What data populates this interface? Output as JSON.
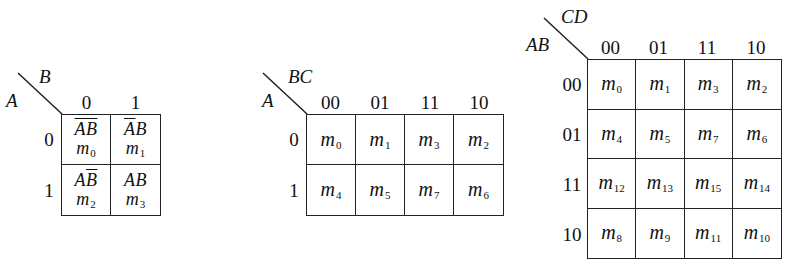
{
  "kmaps": [
    {
      "id": "two-variable",
      "row_var": "A",
      "col_var": "B",
      "col_headers": [
        "0",
        "1"
      ],
      "row_headers": [
        "0",
        "1"
      ],
      "cells": [
        [
          {
            "term_parts": [
              {
                "t": "A",
                "bar": true
              },
              {
                "t": "B",
                "bar": true
              }
            ],
            "m": "m",
            "idx": "0"
          },
          {
            "term_parts": [
              {
                "t": "A",
                "bar": true
              },
              {
                "t": "B",
                "bar": false
              }
            ],
            "m": "m",
            "idx": "1"
          }
        ],
        [
          {
            "term_parts": [
              {
                "t": "A",
                "bar": false
              },
              {
                "t": "B",
                "bar": true
              }
            ],
            "m": "m",
            "idx": "2"
          },
          {
            "term_parts": [
              {
                "t": "A",
                "bar": false
              },
              {
                "t": "B",
                "bar": false
              }
            ],
            "m": "m",
            "idx": "3"
          }
        ]
      ]
    },
    {
      "id": "three-variable",
      "row_var": "A",
      "col_var": "BC",
      "col_headers": [
        "00",
        "01",
        "11",
        "10"
      ],
      "row_headers": [
        "0",
        "1"
      ],
      "cells": [
        [
          {
            "m": "m",
            "idx": "0"
          },
          {
            "m": "m",
            "idx": "1"
          },
          {
            "m": "m",
            "idx": "3"
          },
          {
            "m": "m",
            "idx": "2"
          }
        ],
        [
          {
            "m": "m",
            "idx": "4"
          },
          {
            "m": "m",
            "idx": "5"
          },
          {
            "m": "m",
            "idx": "7"
          },
          {
            "m": "m",
            "idx": "6"
          }
        ]
      ]
    },
    {
      "id": "four-variable",
      "row_var": "AB",
      "col_var": "CD",
      "col_headers": [
        "00",
        "01",
        "11",
        "10"
      ],
      "row_headers": [
        "00",
        "01",
        "11",
        "10"
      ],
      "cells": [
        [
          {
            "m": "m",
            "idx": "0"
          },
          {
            "m": "m",
            "idx": "1"
          },
          {
            "m": "m",
            "idx": "3"
          },
          {
            "m": "m",
            "idx": "2"
          }
        ],
        [
          {
            "m": "m",
            "idx": "4"
          },
          {
            "m": "m",
            "idx": "5"
          },
          {
            "m": "m",
            "idx": "7"
          },
          {
            "m": "m",
            "idx": "6"
          }
        ],
        [
          {
            "m": "m",
            "idx": "12"
          },
          {
            "m": "m",
            "idx": "13"
          },
          {
            "m": "m",
            "idx": "15"
          },
          {
            "m": "m",
            "idx": "14"
          }
        ],
        [
          {
            "m": "m",
            "idx": "8"
          },
          {
            "m": "m",
            "idx": "9"
          },
          {
            "m": "m",
            "idx": "11"
          },
          {
            "m": "m",
            "idx": "10"
          }
        ]
      ]
    }
  ],
  "style": {
    "line_color": "#222222",
    "text_color": "#111111",
    "background": "#ffffff"
  }
}
